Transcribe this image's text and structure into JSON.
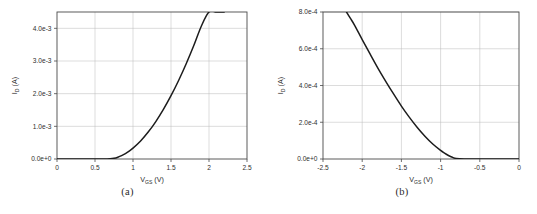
{
  "figure": {
    "background_color": "#ffffff",
    "curve_color": "#1c1c1c",
    "grid_color": "#b9b9b9",
    "axis_color": "#4a4a4a",
    "caption_a": "(a)",
    "caption_b": "(b)"
  },
  "chart_data": [
    {
      "type": "line",
      "title": "",
      "panel_label": "(a)",
      "xlabel_main": "V",
      "xlabel_sub": "GS",
      "xlabel_unit": " (V)",
      "xlabel": "V_GS (V)",
      "ylabel_main": "I",
      "ylabel_sub": "D",
      "ylabel_unit": " (A)",
      "ylabel": "I_D (A)",
      "xlim": [
        0,
        2.5
      ],
      "ylim": [
        0,
        0.0045
      ],
      "xticks": [
        0,
        0.5,
        1,
        1.5,
        2,
        2.5
      ],
      "xticklabels": [
        "0",
        "0.5",
        "1",
        "1.5",
        "2",
        "2.5"
      ],
      "yticks": [
        0,
        0.001,
        0.002,
        0.003,
        0.004
      ],
      "yticklabels": [
        "0.0e+0",
        "1.0e-3",
        "2.0e-3",
        "3.0e-3",
        "4.0e-3"
      ],
      "grid": true,
      "legend": null,
      "series": [
        {
          "name": "NMOS transfer characteristic",
          "x": [
            0.0,
            0.1,
            0.2,
            0.3,
            0.4,
            0.5,
            0.6,
            0.65,
            0.7,
            0.75,
            0.8,
            0.85,
            0.9,
            0.95,
            1.0,
            1.1,
            1.2,
            1.3,
            1.4,
            1.5,
            1.6,
            1.7,
            1.8,
            1.9,
            2.0,
            2.1,
            2.2
          ],
          "y": [
            0.0,
            0.0,
            0.0,
            0.0,
            0.0,
            0.0,
            0.0,
            0.0,
            4e-06,
            2.2e-05,
            5.6e-05,
            0.000104,
            0.000166,
            0.000242,
            0.000332,
            0.000552,
            0.000824,
            0.001146,
            0.001518,
            0.001938,
            0.002404,
            0.002916,
            0.003472,
            0.004072,
            0.0045,
            0.0045,
            0.0045
          ]
        }
      ]
    },
    {
      "type": "line",
      "title": "",
      "panel_label": "(b)",
      "xlabel_main": "V",
      "xlabel_sub": "GS",
      "xlabel_unit": " (V)",
      "xlabel": "V_GS (V)",
      "ylabel_main": "I",
      "ylabel_sub": "D",
      "ylabel_unit": " (A)",
      "ylabel": "I_D (A)",
      "xlim": [
        -2.5,
        0
      ],
      "ylim": [
        0,
        0.0008
      ],
      "xticks": [
        -2.5,
        -2,
        -1.5,
        -1,
        -0.5,
        0
      ],
      "xticklabels": [
        "-2.5",
        "-2",
        "-1.5",
        "-1",
        "-0.5",
        "0"
      ],
      "yticks": [
        0,
        0.0002,
        0.0004,
        0.0006,
        0.0008
      ],
      "yticklabels": [
        "0.0e+0",
        "2.0e-4",
        "4.0e-4",
        "6.0e-4",
        "8.0e-4"
      ],
      "grid": true,
      "legend": null,
      "series": [
        {
          "name": "PMOS transfer characteristic",
          "x": [
            -2.2,
            -2.15,
            -2.1,
            -2.0,
            -1.9,
            -1.8,
            -1.7,
            -1.6,
            -1.5,
            -1.4,
            -1.3,
            -1.2,
            -1.1,
            -1.0,
            -0.95,
            -0.9,
            -0.85,
            -0.8,
            -0.7,
            -0.6,
            -0.5,
            -0.4,
            -0.3,
            -0.2,
            -0.1,
            0.0
          ],
          "y": [
            0.0008,
            0.000765,
            0.00073,
            0.00065,
            0.000572,
            0.000495,
            0.000423,
            0.000354,
            0.000288,
            0.000228,
            0.000173,
            0.000124,
            8.15e-05,
            4.65e-05,
            3.18e-05,
            1.9e-05,
            9.2e-06,
            2.8e-06,
            0.0,
            0.0,
            0.0,
            0.0,
            0.0,
            0.0,
            0.0,
            0.0
          ]
        }
      ]
    }
  ]
}
